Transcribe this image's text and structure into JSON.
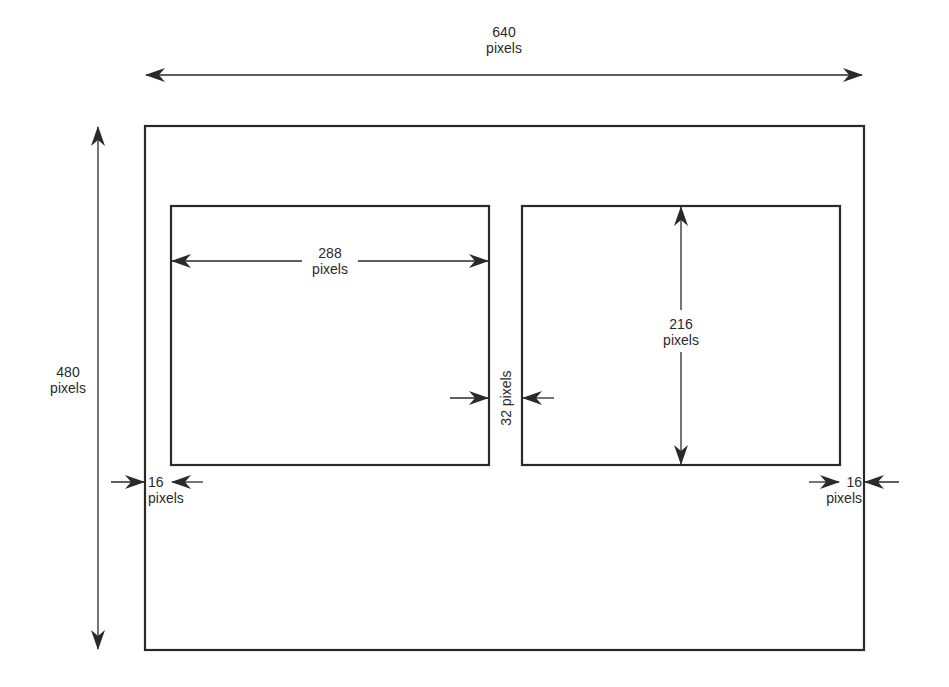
{
  "diagram": {
    "type": "screen-layout-dimension-diagram",
    "colors": {
      "line": "#2a2a2a",
      "background": "#ffffff"
    },
    "screen": {
      "width_label": {
        "value": "640",
        "unit": "pixels"
      },
      "height_label": {
        "value": "480",
        "unit": "pixels"
      }
    },
    "left_panel": {
      "width_label": {
        "value": "288",
        "unit": "pixels"
      }
    },
    "right_panel": {
      "height_label": {
        "value": "216",
        "unit": "pixels"
      }
    },
    "gap_label": {
      "text": "32 pixels"
    },
    "left_margin_label": {
      "value": "16",
      "unit": "pixels"
    },
    "right_margin_label": {
      "value": "16",
      "unit": "pixels"
    }
  }
}
